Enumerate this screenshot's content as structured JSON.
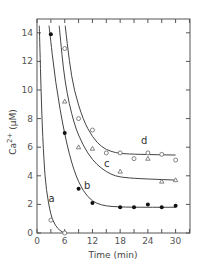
{
  "chart_data": {
    "type": "scatter",
    "title": "",
    "xlabel": "Time (min)",
    "ylabel": "Ca2+ (μM)",
    "ylabel_parts": {
      "base": "Ca",
      "sup": "2+",
      "unit": "(μM)"
    },
    "xlim": [
      0,
      33
    ],
    "ylim": [
      0,
      14.5
    ],
    "xticks": [
      0,
      6,
      12,
      18,
      24,
      30
    ],
    "yticks": [
      0,
      2,
      4,
      6,
      8,
      10,
      12,
      14
    ],
    "grid": false,
    "legend": "inline curve labels",
    "series": [
      {
        "name": "a",
        "marker": "open-circle",
        "points": [
          [
            3,
            0.9
          ],
          [
            6,
            0
          ]
        ],
        "fit": [
          [
            0.5,
            14.5
          ],
          [
            1,
            8.5
          ],
          [
            1.5,
            5.0
          ],
          [
            2,
            3.0
          ],
          [
            3,
            1.2
          ],
          [
            4,
            0.5
          ],
          [
            5,
            0.15
          ],
          [
            6,
            0
          ]
        ]
      },
      {
        "name": "b",
        "marker": "filled-circle",
        "points": [
          [
            3,
            13.9
          ],
          [
            6,
            7.0
          ],
          [
            9,
            3.1
          ],
          [
            12,
            2.1
          ],
          [
            18,
            1.8
          ],
          [
            21,
            1.8
          ],
          [
            24,
            2.0
          ],
          [
            27,
            1.8
          ],
          [
            30,
            1.9
          ]
        ],
        "fit": [
          [
            2.6,
            14.5
          ],
          [
            4,
            10.5
          ],
          [
            6,
            6.8
          ],
          [
            8,
            4.3
          ],
          [
            10,
            2.9
          ],
          [
            12,
            2.2
          ],
          [
            14,
            1.95
          ],
          [
            16,
            1.85
          ],
          [
            20,
            1.8
          ],
          [
            30,
            1.8
          ]
        ]
      },
      {
        "name": "c",
        "marker": "open-triangle",
        "points": [
          [
            6,
            9.2
          ],
          [
            9,
            6.0
          ],
          [
            12,
            5.9
          ],
          [
            18,
            4.3
          ],
          [
            24,
            5.2
          ],
          [
            27,
            3.6
          ],
          [
            30,
            3.7
          ]
        ],
        "fit": [
          [
            4.8,
            14.5
          ],
          [
            6,
            10.5
          ],
          [
            8,
            7.6
          ],
          [
            10,
            6.1
          ],
          [
            12,
            5.1
          ],
          [
            14,
            4.5
          ],
          [
            16,
            4.1
          ],
          [
            18,
            3.9
          ],
          [
            22,
            3.8
          ],
          [
            30,
            3.7
          ]
        ]
      },
      {
        "name": "d",
        "marker": "open-circle",
        "points": [
          [
            6,
            12.9
          ],
          [
            9,
            8.0
          ],
          [
            12,
            7.2
          ],
          [
            15,
            5.6
          ],
          [
            18,
            5.6
          ],
          [
            21,
            5.2
          ],
          [
            24,
            5.6
          ],
          [
            27,
            5.5
          ],
          [
            30,
            5.1
          ]
        ],
        "fit": [
          [
            6.1,
            14.5
          ],
          [
            7,
            12.0
          ],
          [
            8,
            10.0
          ],
          [
            10,
            7.9
          ],
          [
            12,
            6.7
          ],
          [
            14,
            6.0
          ],
          [
            16,
            5.7
          ],
          [
            18,
            5.55
          ],
          [
            22,
            5.5
          ],
          [
            30,
            5.45
          ]
        ]
      }
    ],
    "annotations": [
      {
        "text": "a",
        "x": 2.5,
        "y": 2.2
      },
      {
        "text": "b",
        "x": 10.2,
        "y": 3.1
      },
      {
        "text": "c",
        "x": 14.5,
        "y": 4.6
      },
      {
        "text": "d",
        "x": 22.5,
        "y": 6.2
      }
    ]
  },
  "labels": {
    "xlabel": "Time  (min)",
    "ylabel_base": "Ca",
    "ylabel_sup": "2+",
    "ylabel_unit": "(μM)",
    "a": "a",
    "b": "b",
    "c": "c",
    "d": "d"
  }
}
